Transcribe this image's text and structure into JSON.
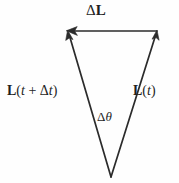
{
  "figure": {
    "type": "vector-diagram",
    "title_text": "",
    "background_color": "#fefefe",
    "stroke_color": "#2b2b2b",
    "text_color": "#1f1f1f",
    "width": 179,
    "height": 183,
    "labels": {
      "delta_L": {
        "name": "delta-L-label",
        "text": "ΔL",
        "delta": "Δ",
        "symbol": "L",
        "bold_symbol": true,
        "x": 110,
        "y": 14
      },
      "L_t_plus_dt": {
        "name": "L-t-plus-delta-t-label",
        "text": "L(t + Δt)",
        "symbol": "L",
        "open_paren": "(",
        "var_t1": "t",
        "plus": " + ",
        "delta": "Δ",
        "var_t2": "t",
        "close_paren": ")",
        "bold_symbol": true,
        "x": 45,
        "y": 92
      },
      "L_t": {
        "name": "L-t-label",
        "text": "L(t)",
        "symbol": "L",
        "open_paren": "(",
        "var_t": "t",
        "close_paren": ")",
        "bold_symbol": true,
        "x": 152,
        "y": 92
      },
      "delta_theta": {
        "name": "delta-theta-label",
        "text": "Δθ",
        "delta": "Δ",
        "symbol": "θ",
        "italic_symbol": true,
        "x": 107,
        "y": 117
      }
    },
    "geometry": {
      "apex": {
        "x": 111,
        "y": 177
      },
      "top_left_vertex": {
        "x": 68,
        "y": 31
      },
      "top_right_vertex": {
        "x": 157,
        "y": 31
      },
      "vectors": [
        {
          "name": "vector-L-t",
          "description": "Angular momentum at time t, drawn from apex up-right",
          "from": {
            "x": 111,
            "y": 177
          },
          "to": {
            "x": 157,
            "y": 31
          },
          "arrowhead": "end"
        },
        {
          "name": "vector-L-t-plus-delta-t",
          "description": "Angular momentum at time t plus delta t, drawn from apex up-left",
          "from": {
            "x": 111,
            "y": 177
          },
          "to": {
            "x": 68,
            "y": 31
          },
          "arrowhead": "end"
        },
        {
          "name": "vector-delta-L",
          "description": "Change in angular momentum, horizontal from right vertex to left vertex",
          "from": {
            "x": 157,
            "y": 31
          },
          "to": {
            "x": 68,
            "y": 31
          },
          "arrowhead": "end"
        }
      ]
    }
  }
}
